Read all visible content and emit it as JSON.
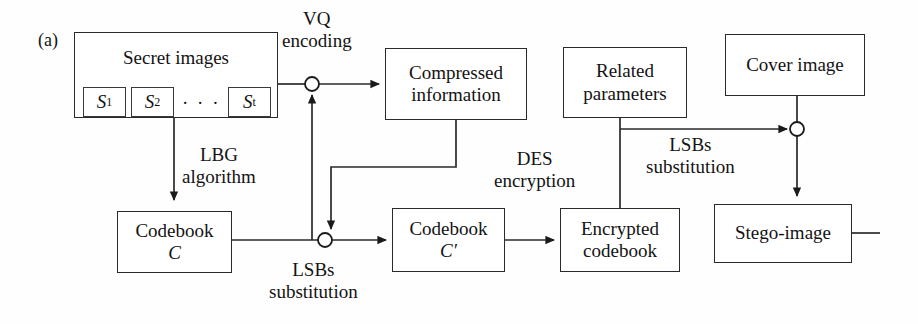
{
  "figure": {
    "panel_label": "(a)",
    "caption_text": ""
  },
  "nodes": [
    {
      "id": "secret-images",
      "label": "Secret images",
      "x": 74,
      "y": 32,
      "w": 204,
      "h": 86,
      "label_top": 22
    },
    {
      "id": "compressed-information",
      "label": "Compressed\ninformation",
      "line1": "Compressed",
      "line2": "information",
      "x": 385,
      "y": 48,
      "w": 142,
      "h": 72
    },
    {
      "id": "related-parameters",
      "label": "Related\nparameters",
      "line1": "Related",
      "line2": "parameters",
      "x": 563,
      "y": 47,
      "w": 124,
      "h": 71
    },
    {
      "id": "cover-image",
      "label": "Cover image",
      "x": 725,
      "y": 34,
      "w": 140,
      "h": 62
    },
    {
      "id": "codebook-c",
      "label": "Codebook\nC",
      "line1": "Codebook",
      "line2": "C",
      "x": 117,
      "y": 211,
      "w": 115,
      "h": 62
    },
    {
      "id": "codebook-c-prime",
      "label": "Codebook\nC'",
      "line1": "Codebook",
      "line2": "C′",
      "x": 392,
      "y": 208,
      "w": 113,
      "h": 64
    },
    {
      "id": "encrypted-codebook",
      "label": "Encrypted\ncodebook",
      "line1": "Encrypted",
      "line2": "codebook",
      "x": 560,
      "y": 208,
      "w": 120,
      "h": 64
    },
    {
      "id": "stego-image",
      "label": "Stego-image",
      "x": 714,
      "y": 204,
      "w": 138,
      "h": 59
    }
  ],
  "secret_image_items": [
    {
      "id": "s1",
      "base": "S",
      "sub": "1",
      "x": 83,
      "y": 87,
      "w": 43,
      "h": 30
    },
    {
      "id": "s2",
      "base": "S",
      "sub": "2",
      "x": 131,
      "y": 87,
      "w": 43,
      "h": 30
    },
    {
      "id": "st",
      "base": "S",
      "sub": "t",
      "x": 228,
      "y": 87,
      "w": 43,
      "h": 30
    }
  ],
  "ellipsis": {
    "text": "· · ·",
    "x": 182,
    "y": 93
  },
  "edge_labels": [
    {
      "id": "vq-encoding",
      "line1": "VQ",
      "line2": "encoding",
      "x": 282,
      "y": 10
    },
    {
      "id": "lbg-algorithm",
      "line1": "LBG",
      "line2": "algorithm",
      "x": 182,
      "y": 148
    },
    {
      "id": "des-encryption",
      "line1": "DES",
      "line2": "encryption",
      "x": 497,
      "y": 152
    },
    {
      "id": "lsbs-substitution-left",
      "line1": "LSBs",
      "line2": "substitution",
      "x": 272,
      "y": 265
    },
    {
      "id": "lsbs-substitution-right",
      "line1": "LSBs",
      "line2": "substitution",
      "x": 650,
      "y": 137
    }
  ],
  "junctions": [
    {
      "id": "vq-junction",
      "cx": 312,
      "cy": 84,
      "r": 7
    },
    {
      "id": "lsb-left-junction",
      "cx": 325,
      "cy": 240,
      "r": 7
    },
    {
      "id": "lsb-right-junction",
      "cx": 797,
      "cy": 129,
      "r": 7
    }
  ],
  "colors": {
    "stroke": "#2a2a2a",
    "fill": "#ffffff",
    "text": "#131313",
    "background": "#fefefe"
  },
  "diagram_type": "block-flow-diagram"
}
